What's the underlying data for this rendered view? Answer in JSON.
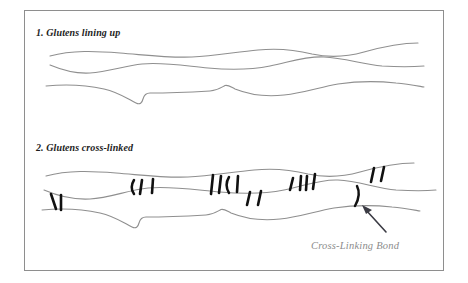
{
  "figure": {
    "title_step_1": "1. Glutens lining up",
    "title_step_2": "2. Glutens cross-linked",
    "annotation_label": "Cross-Linking Bond",
    "colors": {
      "background": "#ffffff",
      "frame_border": "#8e8e8e",
      "strand_line": "#8f8f8f",
      "bond_mark": "#111111",
      "label_text": "#1d1d1d",
      "annotation_text": "#8c8c8c",
      "pointer": "#3b3b44"
    },
    "panel_1": {
      "strand_count": 3,
      "bond_count": 0,
      "description": "Three wavy gluten strands lying parallel with no connections"
    },
    "panel_2": {
      "strand_count": 3,
      "bond_count": 20,
      "description": "Three wavy gluten strands joined by short black cross-linking bond marks"
    },
    "icons": {
      "pointer": "arrow-icon"
    }
  }
}
